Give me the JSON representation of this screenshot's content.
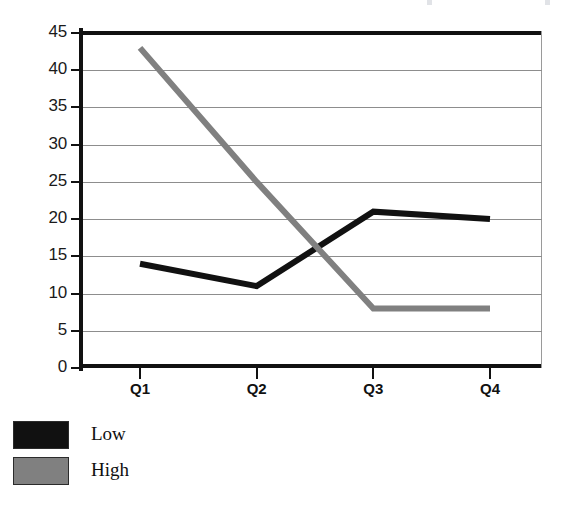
{
  "chart_data": {
    "type": "line",
    "title": "",
    "xlabel": "",
    "ylabel": "",
    "categories": [
      "Q1",
      "Q2",
      "Q3",
      "Q4"
    ],
    "series": [
      {
        "name": "Low",
        "color": "#111111",
        "values": [
          14,
          11,
          21,
          20
        ]
      },
      {
        "name": "High",
        "color": "#808080",
        "values": [
          43,
          25,
          8,
          8
        ]
      }
    ],
    "ylim": [
      0,
      45
    ],
    "ytick_step": 5,
    "ytick_labels": [
      "45",
      "40",
      "35",
      "30",
      "25",
      "20",
      "15",
      "10",
      "5",
      "0"
    ],
    "ytick_values": [
      45,
      40,
      35,
      30,
      25,
      20,
      15,
      10,
      5,
      0
    ],
    "grid": true,
    "grid_axis": "y",
    "legend_position": "bottom-left",
    "legend_entries": [
      {
        "label": "Low",
        "color": "#111111"
      },
      {
        "label": "High",
        "color": "#808080"
      }
    ]
  },
  "axes": {
    "y_labels": [
      "45",
      "40",
      "35",
      "30",
      "25",
      "20",
      "15",
      "10",
      "5",
      "0"
    ],
    "x_labels": [
      "Q1",
      "Q2",
      "Q3",
      "Q4"
    ]
  },
  "legend": {
    "rows": [
      {
        "label": "Low"
      },
      {
        "label": "High"
      }
    ]
  },
  "colors": {
    "low_series": "#111111",
    "high_series": "#808080",
    "axis": "#111111",
    "gridline": "#8d8d8d",
    "background": "#ffffff"
  }
}
